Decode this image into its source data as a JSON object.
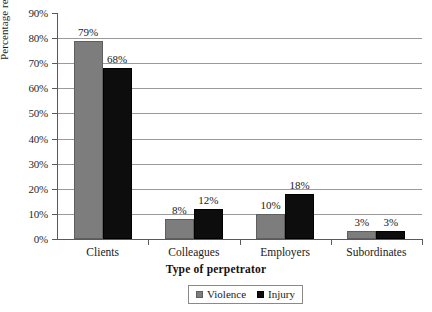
{
  "chart_data": {
    "type": "bar",
    "title": "",
    "xlabel": "Type of perpetrator",
    "ylabel": "Percentage reporting",
    "categories": [
      "Clients",
      "Colleagues",
      "Employers",
      "Subordinates"
    ],
    "series": [
      {
        "name": "Violence",
        "color": "#7d7d7d",
        "values": [
          79,
          8,
          10,
          3
        ],
        "labels": [
          "79%",
          "8%",
          "10%",
          "3%"
        ]
      },
      {
        "name": "Injury",
        "color": "#0d0d0d",
        "values": [
          68,
          12,
          18,
          3
        ],
        "labels": [
          "68%",
          "12%",
          "18%",
          "3%"
        ]
      }
    ],
    "ylim": [
      0,
      90
    ],
    "ytick_values": [
      0,
      10,
      20,
      30,
      40,
      50,
      60,
      70,
      80,
      90
    ],
    "ytick_labels": [
      "0%",
      "10%",
      "20%",
      "30%",
      "40%",
      "50%",
      "60%",
      "70%",
      "80%",
      "90%"
    ],
    "grid": true,
    "grid_axis": "y",
    "legend_position": "bottom",
    "legend_entries": [
      "Violence",
      "Injury"
    ]
  }
}
